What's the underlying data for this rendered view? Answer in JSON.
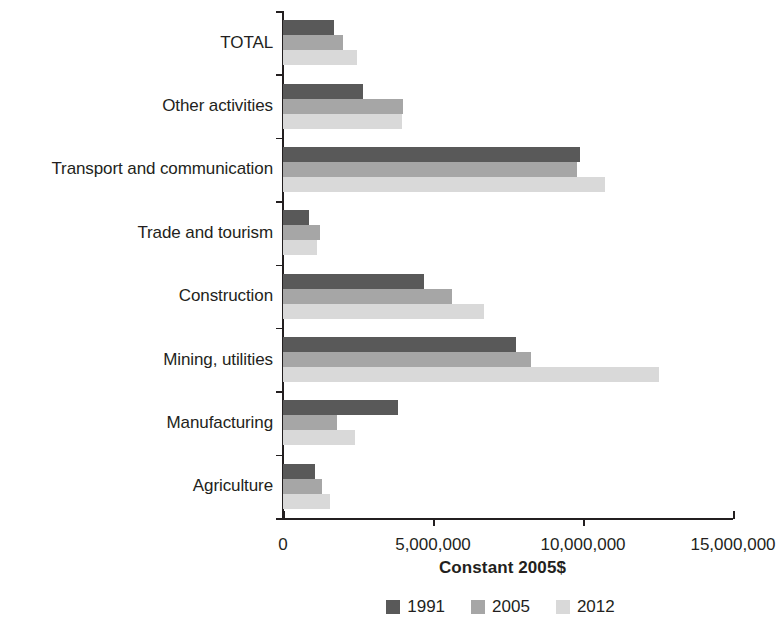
{
  "chart_data": {
    "type": "bar",
    "orientation": "horizontal",
    "title": "",
    "xlabel": "Constant 2005$",
    "ylabel": "",
    "xlim": [
      0,
      15000000
    ],
    "xticks": [
      0,
      5000000,
      10000000,
      15000000
    ],
    "xtick_labels": [
      "0",
      "5,000,000",
      "10,000,000",
      "15,000,000"
    ],
    "grid": false,
    "legend_position": "bottom",
    "categories": [
      "Agriculture",
      "Manufacturing",
      "Mining, utilities",
      "Construction",
      "Trade and tourism",
      "Transport and communication",
      "Other activities",
      "TOTAL"
    ],
    "series": [
      {
        "name": "1991",
        "color": "#595959",
        "values": [
          1070000,
          3840000,
          7770000,
          4700000,
          870000,
          9900000,
          2670000,
          1700000
        ]
      },
      {
        "name": "2005",
        "color": "#a6a6a6",
        "values": [
          1300000,
          1800000,
          8270000,
          5630000,
          1230000,
          9800000,
          4000000,
          2000000
        ]
      },
      {
        "name": "2012",
        "color": "#d9d9d9",
        "values": [
          1570000,
          2400000,
          12530000,
          6700000,
          1130000,
          10730000,
          3970000,
          2470000
        ]
      }
    ]
  },
  "axis": {
    "x_title": "Constant 2005$",
    "tick_labels": [
      "0",
      "5,000,000",
      "10,000,000",
      "15,000,000"
    ]
  },
  "legend": {
    "items": [
      {
        "label": "1991",
        "color": "#595959"
      },
      {
        "label": "2005",
        "color": "#a6a6a6"
      },
      {
        "label": "2012",
        "color": "#d9d9d9"
      }
    ]
  },
  "colors": {
    "axis": "#231f20",
    "text": "#231f20",
    "background": "#ffffff"
  }
}
